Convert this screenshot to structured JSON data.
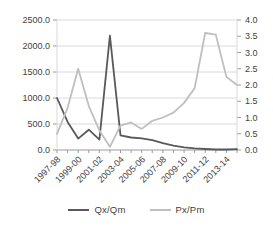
{
  "chart_data": {
    "type": "line",
    "title": "",
    "categories": [
      "1997-98",
      "1998-99",
      "1999-00",
      "2000-01",
      "2001-02",
      "2002-03",
      "2003-04",
      "2004-05",
      "2005-06",
      "2006-07",
      "2007-08",
      "2008-09",
      "2009-10",
      "2010-11",
      "2011-12",
      "2012-13",
      "2013-14",
      "2014-15"
    ],
    "x_tick_labels": [
      "1997-98",
      "1999-00",
      "2001-02",
      "2003-04",
      "2005-06",
      "2007-08",
      "2009-10",
      "2011-12",
      "2013-14"
    ],
    "x_label_every": 2,
    "series": [
      {
        "name": "Qx/Qm",
        "axis": "left",
        "color": "#595959",
        "values": [
          1000,
          540,
          220,
          390,
          200,
          2200,
          280,
          240,
          225,
          190,
          130,
          85,
          50,
          30,
          20,
          10,
          10,
          15
        ]
      },
      {
        "name": "Px/Pm",
        "axis": "right",
        "color": "#bfbfbf",
        "values": [
          0.5,
          1.3,
          2.5,
          1.35,
          0.6,
          0.1,
          0.75,
          0.85,
          0.65,
          0.9,
          1.0,
          1.15,
          1.45,
          1.9,
          3.6,
          3.55,
          2.25,
          2.0
        ]
      }
    ],
    "left_axis": {
      "min": 0,
      "max": 2500,
      "step": 500,
      "tick_labels": [
        "2500.0",
        "2000.0",
        "1500.0",
        "1000.0",
        "500.0",
        "0.0"
      ]
    },
    "right_axis": {
      "min": 0,
      "max": 4,
      "step": 0.5,
      "tick_labels": [
        "4.0",
        "3.5",
        "3.0",
        "2.5",
        "2.0",
        "1.5",
        "1.0",
        "0.5",
        "0.0"
      ]
    },
    "grid": "horizontal",
    "legend_position": "bottom",
    "colors": {
      "background": "#ffffff",
      "gridline": "#d9d9d9",
      "axis_line": "#9b9b9b",
      "label_text": "#3f3f3f"
    }
  },
  "legend": {
    "items": [
      {
        "label": "Qx/Qm"
      },
      {
        "label": "Px/Pm"
      }
    ]
  }
}
